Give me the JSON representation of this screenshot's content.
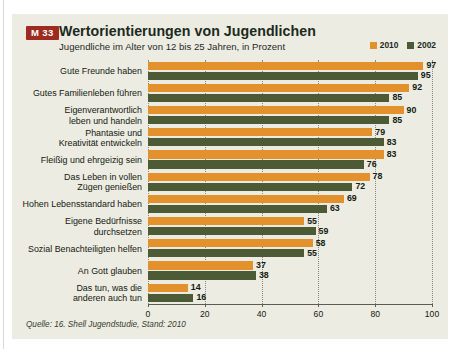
{
  "figure": {
    "badge": "M 33",
    "title": "Wertorientierungen von Jugendlichen",
    "subtitle": "Jugendliche im Alter von 12 bis 25 Jahren, in Prozent",
    "source": "Quelle: 16. Shell Jugendstudie, Stand: 2010",
    "colors": {
      "series_2010": "#e2912d",
      "series_2002": "#4d5a36",
      "badge_bg": "#9d2b20",
      "panel_bg": "#edece3",
      "text": "#14200f"
    }
  },
  "legend": {
    "items": [
      {
        "label": "2010",
        "color": "#e2912d"
      },
      {
        "label": "2002",
        "color": "#4d5a36"
      }
    ]
  },
  "chart_data": {
    "type": "bar",
    "orientation": "horizontal",
    "title": "Wertorientierungen von Jugendlichen",
    "subtitle": "Jugendliche im Alter von 12 bis 25 Jahren, in Prozent",
    "xlabel": "",
    "ylabel": "",
    "xlim": [
      0,
      100
    ],
    "xticks": [
      0,
      20,
      40,
      60,
      80,
      100
    ],
    "xtick_labels": [
      "0",
      "20",
      "40",
      "60",
      "80",
      "100"
    ],
    "grid": true,
    "grid_axis": "x",
    "legend_position": "top-right",
    "categories": [
      "Gute Freunde haben",
      "Gutes Familienleben führen",
      "Eigenverantwortlich leben und handeln",
      "Phantasie und Kreativität entwickeln",
      "Fleißig und ehrgeizig sein",
      "Das Leben in vollen Zügen genießen",
      "Hohen Lebensstandard haben",
      "Eigene Bedürfnisse durchsetzen",
      "Sozial Benachteiligten helfen",
      "An Gott glauben",
      "Das tun, was die anderen auch tun"
    ],
    "category_lines": [
      [
        "Gute Freunde haben"
      ],
      [
        "Gutes Familienleben führen"
      ],
      [
        "Eigenverantwortlich",
        "leben und handeln"
      ],
      [
        "Phantasie und",
        "Kreativität entwickeln"
      ],
      [
        "Fleißig und ehrgeizig sein"
      ],
      [
        "Das Leben in vollen",
        "Zügen genießen"
      ],
      [
        "Hohen Lebensstandard haben"
      ],
      [
        "Eigene Bedürfnisse",
        "durchsetzen"
      ],
      [
        "Sozial Benachteiligten helfen"
      ],
      [
        "An Gott glauben"
      ],
      [
        "Das tun, was die",
        "anderen auch tun"
      ]
    ],
    "series": [
      {
        "name": "2010",
        "color": "#e2912d",
        "values": [
          97,
          92,
          90,
          79,
          83,
          78,
          69,
          55,
          58,
          37,
          14
        ]
      },
      {
        "name": "2002",
        "color": "#4d5a36",
        "values": [
          95,
          85,
          85,
          83,
          76,
          72,
          63,
          59,
          55,
          38,
          16
        ]
      }
    ]
  }
}
